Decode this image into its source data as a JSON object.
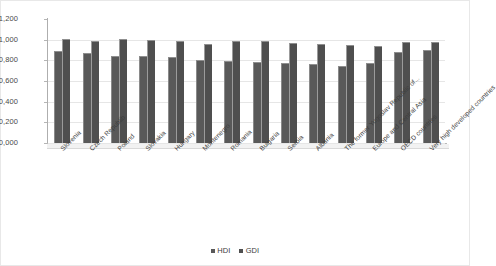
{
  "chart_data": {
    "type": "bar",
    "title": "",
    "subtitle": "",
    "xlabel": "",
    "ylabel": "",
    "ylim": [
      0.0,
      1.2
    ],
    "ytick_labels": [
      "1,200",
      "1,000",
      "0,800",
      "0,600",
      "0,400",
      "0,200",
      "0,000"
    ],
    "ytick_values": [
      1.2,
      1.0,
      0.8,
      0.6,
      0.4,
      0.2,
      0.0
    ],
    "grid": true,
    "legend_position": "bottom",
    "categories": [
      "Slovenia",
      "Czech Republib",
      "Poland",
      "Slovakia",
      "Hungary",
      "Montenegro",
      "Romania",
      "Bulgaria",
      "Serbia",
      "Albania",
      "The former Yugoslav Republic of...",
      "Europe and Central Asia",
      "OECD countries",
      "Very high developed countries"
    ],
    "series": [
      {
        "name": "HDI",
        "color": "#595959",
        "values": [
          0.892,
          0.873,
          0.843,
          0.84,
          0.828,
          0.802,
          0.793,
          0.782,
          0.776,
          0.764,
          0.747,
          0.771,
          0.88,
          0.896
        ]
      },
      {
        "name": "GDI",
        "color": "#4F4F4F",
        "values": [
          1.003,
          0.985,
          1.007,
          1.001,
          0.985,
          0.954,
          0.989,
          0.99,
          0.966,
          0.958,
          0.951,
          0.938,
          0.976,
          0.979
        ]
      }
    ]
  },
  "legend": {
    "items": [
      {
        "label": "HDI"
      },
      {
        "label": "GDI"
      }
    ]
  }
}
